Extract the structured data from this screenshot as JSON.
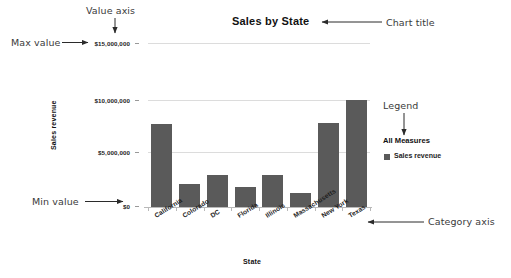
{
  "chart_data": {
    "type": "bar",
    "title": "Sales by State",
    "xlabel": "State",
    "ylabel": "Sales revenue",
    "categories": [
      "California",
      "Colorado",
      "DC",
      "Florida",
      "Illinois",
      "Massachusetts",
      "New York",
      "Texas"
    ],
    "values": [
      7800000,
      2200000,
      3000000,
      1900000,
      3000000,
      1300000,
      7900000,
      10000000
    ],
    "series": [
      {
        "name": "Sales revenue",
        "values": [
          7800000,
          2200000,
          3000000,
          1900000,
          3000000,
          1300000,
          7900000,
          10000000
        ]
      }
    ],
    "ylim": [
      0,
      15000000
    ],
    "ytick_values": [
      0,
      5000000,
      10000000,
      15000000
    ],
    "ytick_labels": [
      "$0",
      "$5,000,000",
      "$10,000,000",
      "$15,000,000"
    ],
    "grid": true,
    "legend": {
      "position": "right",
      "title": "All Measures",
      "entries": [
        {
          "label": "Sales revenue",
          "color": "#5a5a5a"
        }
      ]
    },
    "bar_color": "#5a5a5a",
    "gridline_color": "#dcdcdc",
    "background_color": "#ffffff"
  },
  "annotations": [
    {
      "id": "max-value",
      "text": "Max value",
      "target": "$15,000,000 tick label",
      "arrow": "right"
    },
    {
      "id": "value-axis",
      "text": "Value axis",
      "target": "y axis tick labels",
      "arrow": "down"
    },
    {
      "id": "chart-title",
      "text": "Chart title",
      "target": "Sales by State",
      "arrow": "left"
    },
    {
      "id": "legend",
      "text": "Legend",
      "target": "All Measures legend",
      "arrow": "down"
    },
    {
      "id": "min-value",
      "text": "Min value",
      "target": "$0 tick label",
      "arrow": "right"
    },
    {
      "id": "category-axis",
      "text": "Category axis",
      "target": "x axis",
      "arrow": "left"
    }
  ],
  "axis": {
    "ytick_0": "$0",
    "ytick_5m": "$5,000,000",
    "ytick_10m": "$10,000,000",
    "ytick_15m": "$15,000,000"
  }
}
